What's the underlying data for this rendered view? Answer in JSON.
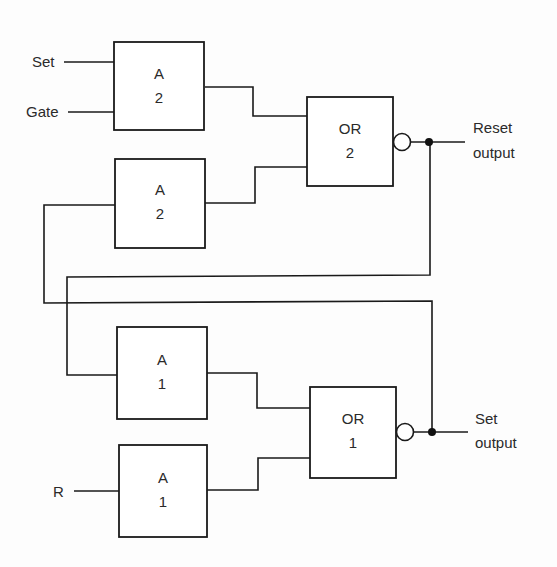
{
  "diagram": {
    "type": "gated SR latch logic diagram",
    "inputs": {
      "set": "Set",
      "gate": "Gate",
      "r": "R"
    },
    "outputs": {
      "reset": {
        "line1": "Reset",
        "line2": "output"
      },
      "set": {
        "line1": "Set",
        "line2": "output"
      }
    },
    "gates": [
      {
        "id": "a2_top",
        "name": "A",
        "num": "2"
      },
      {
        "id": "a2_bottom",
        "name": "A",
        "num": "2"
      },
      {
        "id": "or2",
        "name": "OR",
        "num": "2",
        "inverted_output": true
      },
      {
        "id": "a1_top",
        "name": "A",
        "num": "1"
      },
      {
        "id": "a1_bottom",
        "name": "A",
        "num": "1"
      },
      {
        "id": "or1",
        "name": "OR",
        "num": "1",
        "inverted_output": true
      }
    ],
    "colors": {
      "line": "#1a1a1a",
      "background": "#fdfdfd"
    }
  }
}
